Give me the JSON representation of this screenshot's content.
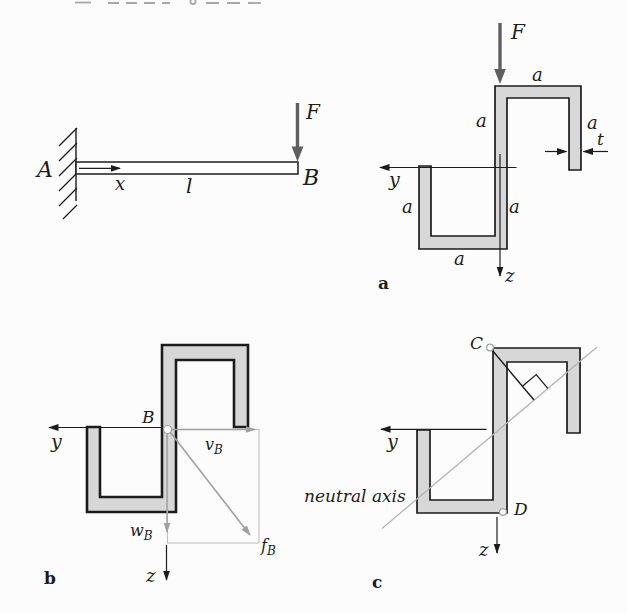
{
  "colors": {
    "background": "#fcfcfc",
    "section_fill": "#d7d7d7",
    "outline": "#1c1c1c",
    "force_arrow": "#5f5f5f",
    "annotation_gray": "#b3b3b3",
    "vector_gray": "#a0a0a0"
  },
  "beam_diagram": {
    "support_label": "A",
    "tip_label": "B",
    "force_label": "F",
    "axis_x_label": "x",
    "length_label": "l"
  },
  "section_a": {
    "tag_label": "a",
    "force_label": "F",
    "axis_y_label": "y",
    "axis_z_label": "z",
    "dim_top_flange": "a",
    "dim_upper_web": "a",
    "dim_right_flange": "a",
    "dim_wall_thickness": "t",
    "dim_left_flange": "a",
    "dim_lower_web": "a",
    "dim_bottom_flange": "a"
  },
  "section_b": {
    "tag_label": "b",
    "axis_y_label": "y",
    "axis_z_label": "z",
    "centroid_label": "B",
    "deflection_y": {
      "base": "v",
      "sub": "B"
    },
    "deflection_z": {
      "base": "w",
      "sub": "B"
    },
    "deflection_resultant": {
      "base": "f",
      "sub": "B"
    }
  },
  "section_c": {
    "tag_label": "c",
    "axis_y_label": "y",
    "axis_z_label": "z",
    "point_c_label": "C",
    "point_d_label": "D",
    "neutral_axis_label": "neutral axis"
  }
}
